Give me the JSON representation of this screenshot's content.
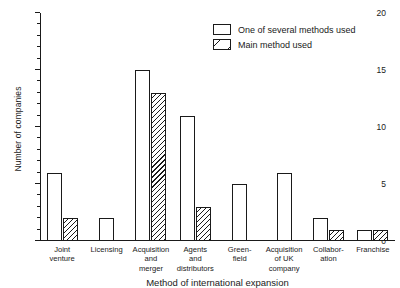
{
  "chart_data": {
    "type": "bar",
    "title": "",
    "xlabel": "Method of international expansion",
    "ylabel": "Number of companies",
    "ylim": [
      0,
      20
    ],
    "ytick_labels": [
      "0",
      "5",
      "10",
      "15",
      "20"
    ],
    "ytick_values": [
      0,
      5,
      10,
      15,
      20
    ],
    "minor_tick_step": 1,
    "grid": false,
    "legend_position": "top-right",
    "categories": [
      "Joint venture",
      "Licensing",
      "Acquisition and merger",
      "Agents and distributors",
      "Greenfield",
      "Acquisition of UK company",
      "Collaboration",
      "Franchise"
    ],
    "category_label_lines": [
      [
        "Joint",
        "venture"
      ],
      [
        "Licensing"
      ],
      [
        "Acquisition",
        "and",
        "merger"
      ],
      [
        "Agents",
        "and",
        "distributors"
      ],
      [
        "Green-",
        "field"
      ],
      [
        "Acquisition",
        "of UK",
        "company"
      ],
      [
        "Collabor-",
        "ation"
      ],
      [
        "Franchise"
      ]
    ],
    "series": [
      {
        "name": "One of several methods used",
        "style": "open",
        "values": [
          6,
          2,
          15,
          11,
          5,
          6,
          2,
          1
        ]
      },
      {
        "name": "Main method used",
        "style": "hatched",
        "values": [
          2,
          0,
          13,
          3,
          0,
          0,
          1,
          1
        ]
      }
    ]
  },
  "legend": {
    "items": [
      {
        "label": "One of several methods used",
        "style": "open"
      },
      {
        "label": "Main method used",
        "style": "hatched"
      }
    ]
  },
  "axes": {
    "y_title": "Number of companies",
    "x_title": "Method of international expansion"
  },
  "colors": {
    "ink": "#1a1a1a",
    "background": "#ffffff"
  }
}
